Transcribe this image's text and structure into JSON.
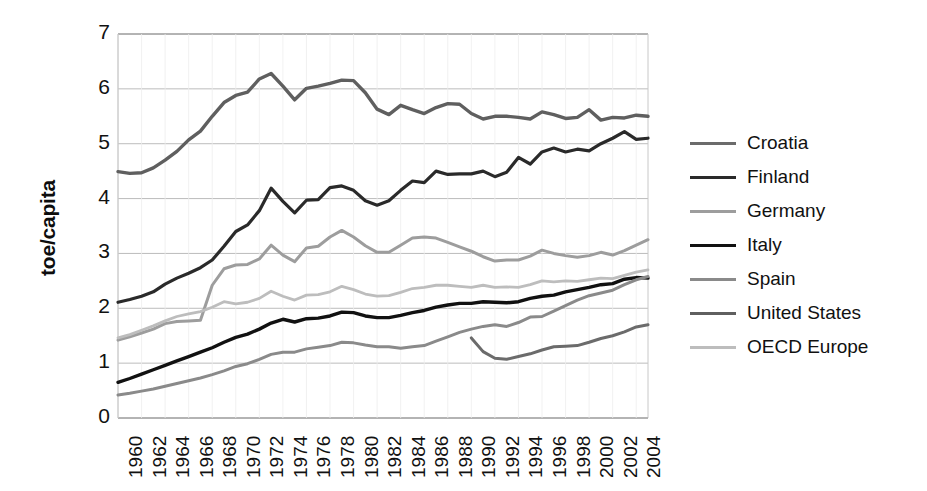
{
  "chart_data": {
    "type": "line",
    "title": "",
    "xlabel": "",
    "ylabel": "toe/capita",
    "xlim": [
      1960,
      2005
    ],
    "ylim": [
      0,
      7
    ],
    "grid": true,
    "legend_position": "right",
    "xtick_labels": [
      "1960",
      "1962",
      "1964",
      "1966",
      "1968",
      "1970",
      "1972",
      "1974",
      "1976",
      "1978",
      "1980",
      "1982",
      "1984",
      "1986",
      "1988",
      "1990",
      "1992",
      "1994",
      "1996",
      "1998",
      "2000",
      "2002",
      "2004"
    ],
    "ytick_labels": [
      "0",
      "1",
      "2",
      "3",
      "4",
      "5",
      "6",
      "7"
    ],
    "x": [
      1960,
      1961,
      1962,
      1963,
      1964,
      1965,
      1966,
      1967,
      1968,
      1969,
      1970,
      1971,
      1972,
      1973,
      1974,
      1975,
      1976,
      1977,
      1978,
      1979,
      1980,
      1981,
      1982,
      1983,
      1984,
      1985,
      1986,
      1987,
      1988,
      1989,
      1990,
      1991,
      1992,
      1993,
      1994,
      1995,
      1996,
      1997,
      1998,
      1999,
      2000,
      2001,
      2002,
      2003,
      2004,
      2005
    ],
    "series": [
      {
        "name": "Croatia",
        "color": "#6b6b6b",
        "width": 3.0,
        "x": [
          1990,
          1991,
          1992,
          1993,
          1994,
          1995,
          1996,
          1997,
          1998,
          1999,
          2000,
          2001,
          2002,
          2003,
          2004,
          2005
        ],
        "values": [
          1.46,
          1.21,
          1.09,
          1.07,
          1.12,
          1.17,
          1.24,
          1.3,
          1.31,
          1.32,
          1.38,
          1.45,
          1.5,
          1.57,
          1.66,
          1.7
        ]
      },
      {
        "name": "Finland",
        "color": "#2a2a2a",
        "width": 3.2,
        "x": [
          1960,
          1961,
          1962,
          1963,
          1964,
          1965,
          1966,
          1967,
          1968,
          1969,
          1970,
          1971,
          1972,
          1973,
          1974,
          1975,
          1976,
          1977,
          1978,
          1979,
          1980,
          1981,
          1982,
          1983,
          1984,
          1985,
          1986,
          1987,
          1988,
          1989,
          1990,
          1991,
          1992,
          1993,
          1994,
          1995,
          1996,
          1997,
          1998,
          1999,
          2000,
          2001,
          2002,
          2003,
          2004,
          2005
        ],
        "values": [
          2.11,
          2.16,
          2.22,
          2.3,
          2.44,
          2.55,
          2.64,
          2.74,
          2.88,
          3.13,
          3.4,
          3.52,
          3.78,
          4.19,
          3.95,
          3.74,
          3.97,
          3.98,
          4.2,
          4.23,
          4.15,
          3.96,
          3.88,
          3.96,
          4.15,
          4.32,
          4.29,
          4.5,
          4.44,
          4.45,
          4.45,
          4.5,
          4.4,
          4.48,
          4.75,
          4.63,
          4.85,
          4.92,
          4.85,
          4.9,
          4.87,
          5.0,
          5.1,
          5.22,
          5.08,
          5.1
        ]
      },
      {
        "name": "Germany",
        "color": "#9d9d9d",
        "width": 3.0,
        "x": [
          1960,
          1961,
          1962,
          1963,
          1964,
          1965,
          1966,
          1967,
          1968,
          1969,
          1970,
          1971,
          1972,
          1973,
          1974,
          1975,
          1976,
          1977,
          1978,
          1979,
          1980,
          1981,
          1982,
          1983,
          1984,
          1985,
          1986,
          1987,
          1988,
          1989,
          1990,
          1991,
          1992,
          1993,
          1994,
          1995,
          1996,
          1997,
          1998,
          1999,
          2000,
          2001,
          2002,
          2003,
          2004,
          2005
        ],
        "values": [
          1.42,
          1.48,
          1.55,
          1.62,
          1.72,
          1.76,
          1.77,
          1.78,
          2.42,
          2.72,
          2.79,
          2.8,
          2.9,
          3.15,
          2.97,
          2.85,
          3.1,
          3.13,
          3.3,
          3.42,
          3.3,
          3.14,
          3.02,
          3.02,
          3.15,
          3.28,
          3.3,
          3.28,
          3.2,
          3.12,
          3.04,
          2.94,
          2.86,
          2.88,
          2.88,
          2.95,
          3.06,
          3.0,
          2.96,
          2.93,
          2.96,
          3.02,
          2.97,
          3.05,
          3.15,
          3.25
        ]
      },
      {
        "name": "Italy",
        "color": "#111111",
        "width": 3.4,
        "x": [
          1960,
          1961,
          1962,
          1963,
          1964,
          1965,
          1966,
          1967,
          1968,
          1969,
          1970,
          1971,
          1972,
          1973,
          1974,
          1975,
          1976,
          1977,
          1978,
          1979,
          1980,
          1981,
          1982,
          1983,
          1984,
          1985,
          1986,
          1987,
          1988,
          1989,
          1990,
          1991,
          1992,
          1993,
          1994,
          1995,
          1996,
          1997,
          1998,
          1999,
          2000,
          2001,
          2002,
          2003,
          2004,
          2005
        ],
        "values": [
          0.65,
          0.72,
          0.8,
          0.88,
          0.96,
          1.04,
          1.12,
          1.2,
          1.28,
          1.38,
          1.47,
          1.53,
          1.62,
          1.73,
          1.8,
          1.75,
          1.81,
          1.82,
          1.86,
          1.93,
          1.92,
          1.86,
          1.83,
          1.83,
          1.87,
          1.92,
          1.96,
          2.02,
          2.06,
          2.09,
          2.09,
          2.12,
          2.11,
          2.1,
          2.12,
          2.18,
          2.22,
          2.24,
          2.3,
          2.34,
          2.38,
          2.43,
          2.45,
          2.53,
          2.56,
          2.55
        ]
      },
      {
        "name": "Spain",
        "color": "#8a8a8a",
        "width": 3.0,
        "x": [
          1960,
          1961,
          1962,
          1963,
          1964,
          1965,
          1966,
          1967,
          1968,
          1969,
          1970,
          1971,
          1972,
          1973,
          1974,
          1975,
          1976,
          1977,
          1978,
          1979,
          1980,
          1981,
          1982,
          1983,
          1984,
          1985,
          1986,
          1987,
          1988,
          1989,
          1990,
          1991,
          1992,
          1993,
          1994,
          1995,
          1996,
          1997,
          1998,
          1999,
          2000,
          2001,
          2002,
          2003,
          2004,
          2005
        ],
        "values": [
          0.42,
          0.45,
          0.49,
          0.53,
          0.58,
          0.63,
          0.68,
          0.73,
          0.79,
          0.86,
          0.94,
          0.99,
          1.07,
          1.16,
          1.2,
          1.2,
          1.26,
          1.29,
          1.32,
          1.38,
          1.37,
          1.33,
          1.3,
          1.3,
          1.27,
          1.3,
          1.32,
          1.4,
          1.48,
          1.56,
          1.62,
          1.67,
          1.7,
          1.67,
          1.74,
          1.84,
          1.85,
          1.95,
          2.05,
          2.15,
          2.23,
          2.28,
          2.33,
          2.43,
          2.52,
          2.58
        ]
      },
      {
        "name": "United States",
        "color": "#5f5f5f",
        "width": 3.4,
        "x": [
          1960,
          1961,
          1962,
          1963,
          1964,
          1965,
          1966,
          1967,
          1968,
          1969,
          1970,
          1971,
          1972,
          1973,
          1974,
          1975,
          1976,
          1977,
          1978,
          1979,
          1980,
          1981,
          1982,
          1983,
          1984,
          1985,
          1986,
          1987,
          1988,
          1989,
          1990,
          1991,
          1992,
          1993,
          1994,
          1995,
          1996,
          1997,
          1998,
          1999,
          2000,
          2001,
          2002,
          2003,
          2004,
          2005
        ],
        "values": [
          4.49,
          4.46,
          4.47,
          4.56,
          4.7,
          4.86,
          5.07,
          5.23,
          5.5,
          5.75,
          5.88,
          5.94,
          6.18,
          6.28,
          6.05,
          5.8,
          6.01,
          6.05,
          6.1,
          6.16,
          6.15,
          5.93,
          5.63,
          5.53,
          5.7,
          5.62,
          5.55,
          5.66,
          5.73,
          5.72,
          5.55,
          5.45,
          5.5,
          5.5,
          5.48,
          5.45,
          5.58,
          5.53,
          5.46,
          5.48,
          5.62,
          5.43,
          5.48,
          5.47,
          5.52,
          5.5
        ]
      },
      {
        "name": "OECD Europe",
        "color": "#bdbdbd",
        "width": 2.8,
        "x": [
          1960,
          1961,
          1962,
          1963,
          1964,
          1965,
          1966,
          1967,
          1968,
          1969,
          1970,
          1971,
          1972,
          1973,
          1974,
          1975,
          1976,
          1977,
          1978,
          1979,
          1980,
          1981,
          1982,
          1983,
          1984,
          1985,
          1986,
          1987,
          1988,
          1989,
          1990,
          1991,
          1992,
          1993,
          1994,
          1995,
          1996,
          1997,
          1998,
          1999,
          2000,
          2001,
          2002,
          2003,
          2004,
          2005
        ],
        "values": [
          1.46,
          1.52,
          1.6,
          1.68,
          1.77,
          1.85,
          1.9,
          1.94,
          2.02,
          2.12,
          2.08,
          2.11,
          2.18,
          2.31,
          2.22,
          2.15,
          2.24,
          2.25,
          2.3,
          2.4,
          2.34,
          2.26,
          2.22,
          2.23,
          2.29,
          2.36,
          2.38,
          2.42,
          2.42,
          2.4,
          2.38,
          2.42,
          2.38,
          2.39,
          2.38,
          2.43,
          2.5,
          2.48,
          2.5,
          2.49,
          2.52,
          2.55,
          2.54,
          2.6,
          2.66,
          2.7
        ]
      }
    ]
  },
  "legend": {
    "items": [
      {
        "label": "Croatia"
      },
      {
        "label": "Finland"
      },
      {
        "label": "Germany"
      },
      {
        "label": "Italy"
      },
      {
        "label": "Spain"
      },
      {
        "label": "United States"
      },
      {
        "label": "OECD Europe"
      }
    ]
  }
}
